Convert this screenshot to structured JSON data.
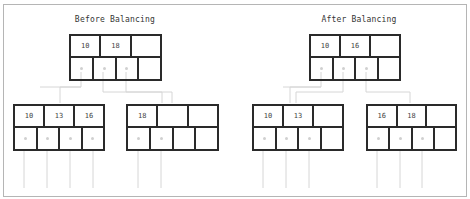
{
  "diagram": {
    "type": "B-tree node rebalancing",
    "panels": [
      {
        "title": "Before Balancing",
        "root": {
          "keys": [
            "10",
            "18",
            ""
          ],
          "pointers": [
            true,
            true,
            true,
            false
          ]
        },
        "children": [
          {
            "keys": [
              "10",
              "13",
              "16"
            ],
            "pointers": [
              true,
              true,
              true,
              true
            ]
          },
          {
            "keys": [
              "18",
              "",
              ""
            ],
            "pointers": [
              true,
              true,
              false,
              false
            ]
          }
        ]
      },
      {
        "title": "After Balancing",
        "root": {
          "keys": [
            "10",
            "16",
            ""
          ],
          "pointers": [
            true,
            true,
            true,
            false
          ]
        },
        "children": [
          {
            "keys": [
              "10",
              "13",
              ""
            ],
            "pointers": [
              true,
              true,
              true,
              false
            ]
          },
          {
            "keys": [
              "16",
              "18",
              ""
            ],
            "pointers": [
              true,
              true,
              true,
              false
            ]
          }
        ]
      }
    ],
    "colors": {
      "border": "#2a2a2a",
      "connector": "#d0d0d0",
      "frame": "#b5b5b5"
    }
  }
}
